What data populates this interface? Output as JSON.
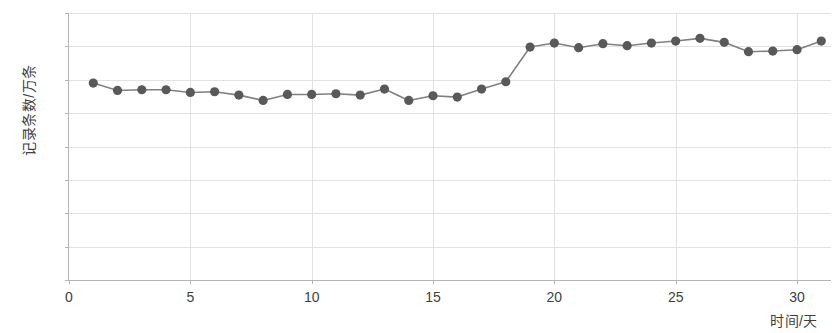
{
  "chart_data": {
    "type": "line",
    "title": "",
    "xlabel": "时间/天",
    "ylabel": "记录条数/万条",
    "xlim": [
      0,
      31.4
    ],
    "ylim": [
      0,
      4
    ],
    "grid": true,
    "legend": "none",
    "x_ticks": [
      0,
      5,
      10,
      15,
      20,
      25,
      30
    ],
    "y_ticks": [
      0,
      0.5,
      1,
      1.5,
      2,
      2.5,
      3,
      3.5,
      4
    ],
    "marker": "circle",
    "marker_color": "#595959",
    "line_color": "#808080",
    "grid_color": "#e2e2e2",
    "axis_color": "#b4b4b4",
    "x": [
      1,
      2,
      3,
      4,
      5,
      6,
      7,
      8,
      9,
      10,
      11,
      12,
      13,
      14,
      15,
      16,
      17,
      18,
      19,
      20,
      21,
      22,
      23,
      24,
      25,
      26,
      27,
      28,
      29,
      30,
      31
    ],
    "series": [
      {
        "name": "记录条数",
        "values": [
          2.95,
          2.84,
          2.85,
          2.85,
          2.81,
          2.82,
          2.77,
          2.69,
          2.78,
          2.78,
          2.79,
          2.77,
          2.86,
          2.69,
          2.76,
          2.74,
          2.86,
          2.97,
          3.49,
          3.55,
          3.48,
          3.54,
          3.51,
          3.55,
          3.58,
          3.62,
          3.56,
          3.42,
          3.43,
          3.45,
          3.58
        ]
      }
    ]
  }
}
